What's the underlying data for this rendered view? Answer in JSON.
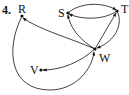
{
  "problem_number": "4.",
  "graph": {
    "type": "directed",
    "nodes": [
      {
        "id": "R",
        "label": "R",
        "x": 22,
        "y": 16
      },
      {
        "id": "S",
        "label": "S",
        "x": 68,
        "y": 13
      },
      {
        "id": "T",
        "label": "T",
        "x": 117,
        "y": 11
      },
      {
        "id": "W",
        "label": "W",
        "x": 95,
        "y": 49
      },
      {
        "id": "V",
        "label": "V",
        "x": 41,
        "y": 70
      }
    ],
    "edges": [
      {
        "from": "S",
        "to": "T"
      },
      {
        "from": "T",
        "to": "S"
      },
      {
        "from": "W",
        "to": "S"
      },
      {
        "from": "W",
        "to": "T"
      },
      {
        "from": "T",
        "to": "W"
      },
      {
        "from": "W",
        "to": "R"
      },
      {
        "from": "R",
        "to": "W"
      },
      {
        "from": "W",
        "to": "V"
      }
    ]
  }
}
